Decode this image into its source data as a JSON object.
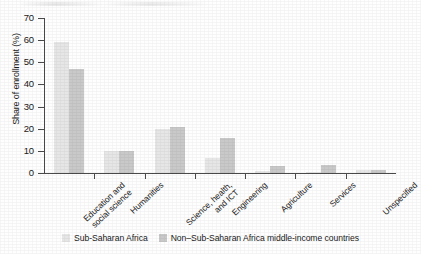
{
  "chart_data": {
    "type": "bar",
    "title": "",
    "xlabel": "",
    "ylabel": "Share of enrollment (%)",
    "ylim": [
      0,
      70
    ],
    "ytick_step": 10,
    "yticks": [
      0,
      10,
      20,
      30,
      40,
      50,
      60,
      70
    ],
    "grid": false,
    "legend_position": "bottom",
    "categories": [
      "Education and\nsocial science",
      "Humanities",
      "Science, health,\nand ICT",
      "Engineering",
      "Agriculture",
      "Services",
      "Unspecified"
    ],
    "series": [
      {
        "name": "Sub-Saharan Africa",
        "color": "#e6e6e6",
        "values": [
          59,
          10,
          20,
          7,
          1,
          0.6,
          1.2
        ]
      },
      {
        "name": "Non–Sub-Saharan Africa middle-income countries",
        "color": "#c9c9c9",
        "values": [
          47,
          10,
          21,
          16,
          3,
          3.5,
          1.5
        ]
      }
    ]
  },
  "legend": {
    "items": [
      {
        "label": "Sub-Saharan Africa",
        "color": "#e6e6e6"
      },
      {
        "label": "Non–Sub-Saharan Africa middle-income countries",
        "color": "#c9c9c9"
      }
    ]
  },
  "axis": {
    "y_title": "Share of enrollment (%)",
    "y_tick_labels": [
      "0",
      "10",
      "20",
      "30",
      "40",
      "50",
      "60",
      "70"
    ]
  }
}
